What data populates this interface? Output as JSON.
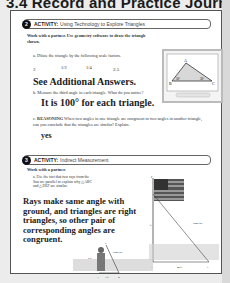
{
  "header": {
    "title": "3.4 Record and Practice Journal"
  },
  "activity1": {
    "number": "2",
    "label": "ACTIVITY:",
    "title": "Using Technology to Explore Triangles",
    "intro": "Work with a partner. Use geometry software to draw the triangle shown.",
    "part_a": {
      "letter": "a.",
      "prompt": "Dilate the triangle by the following scale factors.",
      "factors": [
        "2",
        "1/2",
        "1/4",
        "2.5"
      ],
      "answer": "See Additional Answers."
    },
    "part_b": {
      "letter": "b.",
      "prompt": "Measure the third angle in each triangle. What do you notice?",
      "answer": "It is 100° for each triangle."
    },
    "part_c": {
      "letter": "c.",
      "label": "REASONING",
      "prompt": "When two angles in one triangle are congruent to two angles in another triangle, can you conclude that the triangles are similar? Explain.",
      "answer": "yes"
    },
    "figure": {
      "vertices": [
        "A",
        "B",
        "C"
      ],
      "angles": [
        "50°",
        "30°"
      ]
    }
  },
  "activity2": {
    "number": "3",
    "label": "ACTIVITY:",
    "title": "Indirect Measurement",
    "intro": "Work with a partner.",
    "part_a": {
      "letter": "a.",
      "prompt": "Use the fact that two rays from the Sun are parallel to explain why △ABC and △DEF are similar.",
      "answer": "Rays make same angle with ground, and triangles are right triangles, so other pair of corresponding angles are congruent."
    },
    "figure": {
      "labels": [
        "C",
        "F",
        "Sun's ray",
        "Sun's ray",
        "5 ft",
        "x ft",
        "3 ft",
        "40 ft",
        "A",
        "B",
        "D",
        "E"
      ]
    }
  }
}
